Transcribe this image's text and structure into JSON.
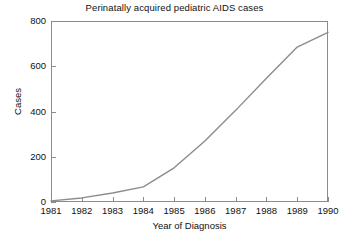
{
  "chart_data": {
    "type": "line",
    "title": "Perinatally acquired pediatric AIDS cases",
    "xlabel": "Year of Diagnosis",
    "ylabel": "Cases",
    "x": [
      1981,
      1982,
      1983,
      1984,
      1985,
      1986,
      1987,
      1988,
      1989,
      1990
    ],
    "values": [
      5,
      18,
      40,
      67,
      151,
      270,
      405,
      547,
      685,
      750
    ],
    "xtick_labels": [
      "1981",
      "1982",
      "1983",
      "1984",
      "1985",
      "1986",
      "1987",
      "1988",
      "1989",
      "1990"
    ],
    "ytick_labels": [
      "0",
      "200",
      "400",
      "600",
      "800"
    ],
    "ytick_values": [
      0,
      200,
      400,
      600,
      800
    ],
    "xlim": [
      1981,
      1990
    ],
    "ylim": [
      0,
      800
    ],
    "grid": false,
    "legend": false,
    "series": [
      {
        "name": "Perinatally acquired pediatric AIDS cases",
        "values": [
          5,
          18,
          40,
          67,
          151,
          270,
          405,
          547,
          685,
          750
        ],
        "color": "#8c8c8c"
      }
    ],
    "line_color": "#8c8c8c",
    "axis_color": "#8c8c8c",
    "background_color": "#ffffff",
    "text_color": "#111111"
  }
}
